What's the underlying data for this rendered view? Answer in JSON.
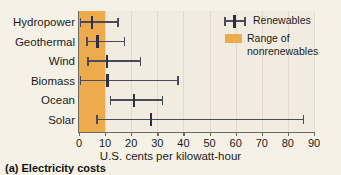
{
  "caption": "(a) Electricity costs",
  "legend": {
    "renewables_label": "Renewables",
    "nonrenewables_label": "Range of nonrenewables",
    "marker_color": "#2e2e42",
    "band_color": "#eeab4b"
  },
  "chart_data": {
    "type": "bar",
    "subtype": "horizontal-error-bar-dot-plot",
    "title": "(a) Electricity costs",
    "xlabel": "U.S. cents per kilowatt-hour",
    "ylabel": "",
    "xlim": [
      0,
      90
    ],
    "xticks": [
      0,
      10,
      20,
      30,
      40,
      50,
      60,
      70,
      80,
      90
    ],
    "xtick_labels": [
      "0",
      "10",
      "20",
      "30",
      "40",
      "50",
      "60",
      "70",
      "80",
      "90"
    ],
    "grid": true,
    "legend_position": "top-right",
    "categories": [
      "Hydropower",
      "Geothermal",
      "Wind",
      "Biomass",
      "Ocean",
      "Solar"
    ],
    "series": [
      {
        "name": "Renewables",
        "points": [
          {
            "category": "Hydropower",
            "low": 0.5,
            "value": 5.0,
            "high": 15.0
          },
          {
            "category": "Geothermal",
            "low": 3.0,
            "value": 7.0,
            "high": 17.5
          },
          {
            "category": "Wind",
            "low": 3.5,
            "value": 10.7,
            "high": 23.5
          },
          {
            "category": "Biomass",
            "low": 0.5,
            "value": 11.0,
            "high": 38.0
          },
          {
            "category": "Ocean",
            "low": 12.0,
            "value": 21.0,
            "high": 32.0
          },
          {
            "category": "Solar",
            "low": 7.0,
            "value": 27.5,
            "high": 86.0
          }
        ]
      }
    ],
    "bands": [
      {
        "name": "Range of nonrenewables",
        "start": 0,
        "end": 10,
        "color": "#eeab4b"
      }
    ],
    "annotations": []
  }
}
